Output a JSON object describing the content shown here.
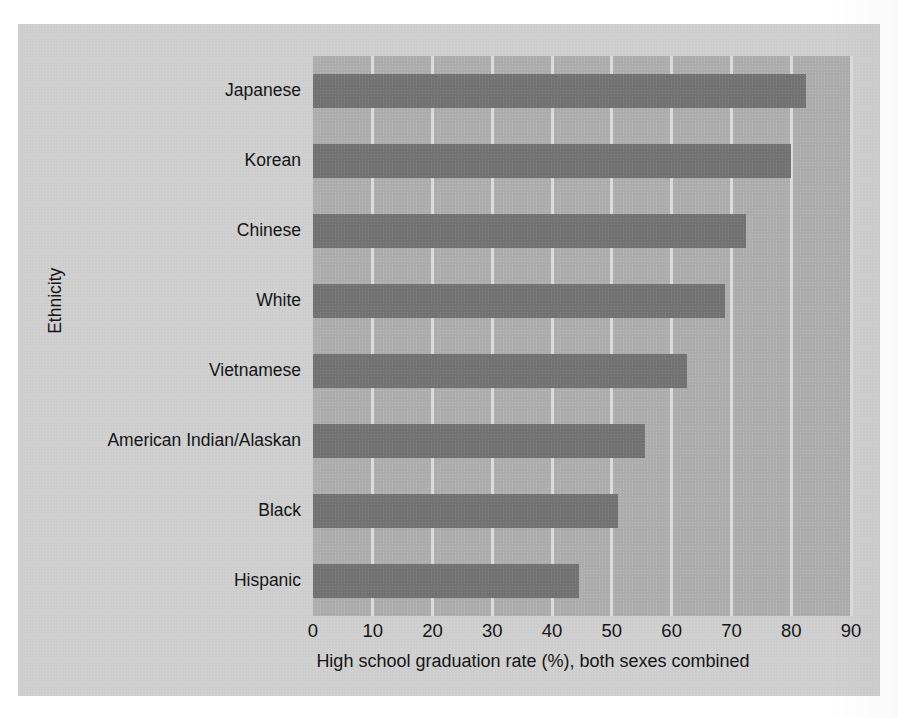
{
  "chart_data": {
    "type": "bar",
    "orientation": "horizontal",
    "title": "",
    "xlabel": "High school graduation rate (%), both sexes combined",
    "ylabel": "Ethnicity",
    "categories": [
      "Japanese",
      "Korean",
      "Chinese",
      "White",
      "Vietnamese",
      "American Indian/Alaskan",
      "Black",
      "Hispanic"
    ],
    "values": [
      82.5,
      80.0,
      72.5,
      69.0,
      62.5,
      55.5,
      51.0,
      44.5
    ],
    "xlim": [
      0,
      90
    ],
    "xticks": [
      0,
      10,
      20,
      30,
      40,
      50,
      60,
      70,
      80,
      90
    ],
    "xticklabels": [
      "0",
      "10",
      "20",
      "30",
      "40",
      "50",
      "60",
      "70",
      "80",
      "90"
    ],
    "grid": "vertical",
    "legend": "none",
    "bar_color": "#787878",
    "plot_background": "#b2b2b2",
    "figure_background": "#d2d2d2",
    "gridline_color": "#dedede",
    "text_color": "#141414"
  }
}
